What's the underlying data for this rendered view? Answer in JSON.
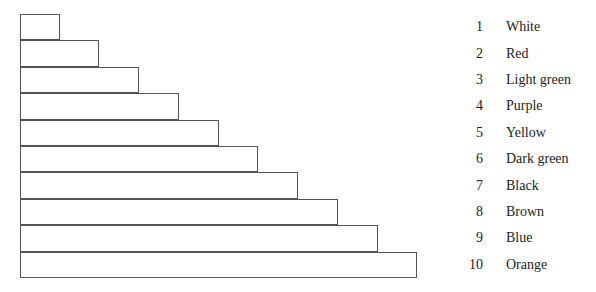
{
  "chart_data": {
    "type": "bar",
    "orientation": "horizontal-stacked-staircase",
    "title": "",
    "categories": [
      "1",
      "2",
      "3",
      "4",
      "5",
      "6",
      "7",
      "8",
      "9",
      "10"
    ],
    "values": [
      1,
      2,
      3,
      4,
      5,
      6,
      7,
      8,
      9,
      10
    ],
    "labels": [
      "White",
      "Red",
      "Light green",
      "Purple",
      "Yellow",
      "Dark green",
      "Black",
      "Brown",
      "Blue",
      "Orange"
    ],
    "xlabel": "",
    "ylabel": "",
    "grid": false,
    "legend_position": "right"
  },
  "bars": [
    {
      "index": "1",
      "width": 40
    },
    {
      "index": "2",
      "width": 79
    },
    {
      "index": "3",
      "width": 119
    },
    {
      "index": "4",
      "width": 159
    },
    {
      "index": "5",
      "width": 199
    },
    {
      "index": "6",
      "width": 238
    },
    {
      "index": "7",
      "width": 278
    },
    {
      "index": "8",
      "width": 318
    },
    {
      "index": "9",
      "width": 358
    },
    {
      "index": "10",
      "width": 397
    }
  ],
  "legend": [
    {
      "num": "1",
      "label": "White"
    },
    {
      "num": "2",
      "label": "Red"
    },
    {
      "num": "3",
      "label": "Light green"
    },
    {
      "num": "4",
      "label": "Purple"
    },
    {
      "num": "5",
      "label": "Yellow"
    },
    {
      "num": "6",
      "label": "Dark green"
    },
    {
      "num": "7",
      "label": "Black"
    },
    {
      "num": "8",
      "label": "Brown"
    },
    {
      "num": "9",
      "label": "Blue"
    },
    {
      "num": "10",
      "label": "Orange"
    }
  ]
}
